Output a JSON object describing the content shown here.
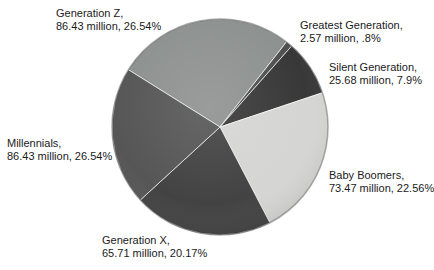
{
  "chart_data": {
    "type": "pie",
    "title": "",
    "legend_position": "none",
    "labels_position": "outside",
    "background_color": "#ffffff",
    "label_text_color": "#1a1a1a",
    "start_angle_deg_from_12": -58,
    "slices": [
      {
        "name": "Generation Z",
        "label_line1": "Generation Z,",
        "label_line2": "86.43 million, 26.54%",
        "value_million": 86.43,
        "percent": 26.54,
        "color": "#8d918f",
        "span_deg": 96
      },
      {
        "name": "Greatest Generation",
        "label_line1": "Greatest Generation,",
        "label_line2": "2.57 million, .8%",
        "value_million": 2.57,
        "percent": 0.8,
        "color": "#4f4f4f",
        "span_deg": 3.5
      },
      {
        "name": "Silent Generation",
        "label_line1": "Silent Generation,",
        "label_line2": "25.68 million, 7.9%",
        "value_million": 25.68,
        "percent": 7.9,
        "color": "#383838",
        "span_deg": 30
      },
      {
        "name": "Baby Boomers",
        "label_line1": "Baby Boomers,",
        "label_line2": "73.47 million, 22.56%",
        "value_million": 73.47,
        "percent": 22.56,
        "color": "#d5d5d3",
        "span_deg": 81
      },
      {
        "name": "Generation X",
        "label_line1": "Generation X,",
        "label_line2": "65.71 million, 20.17%",
        "value_million": 65.71,
        "percent": 20.17,
        "color": "#434343",
        "span_deg": 75
      },
      {
        "name": "Millennials",
        "label_line1": "Millennials,",
        "label_line2": "86.43 million, 26.54%",
        "value_million": 86.43,
        "percent": 26.54,
        "color": "#565656",
        "span_deg": 74.5
      }
    ]
  }
}
